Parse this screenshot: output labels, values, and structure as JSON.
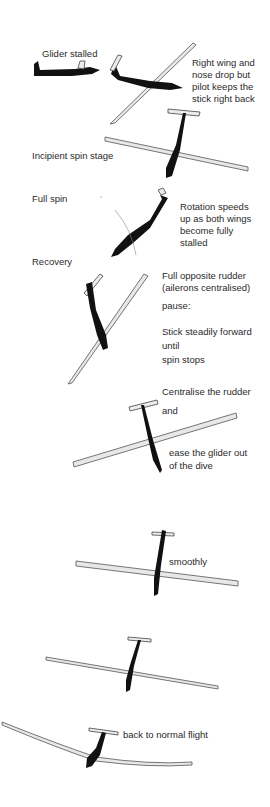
{
  "diagram": {
    "stages": [
      {
        "id": "stalled",
        "label": "Glider stalled"
      },
      {
        "id": "incipient",
        "label": "Incipient spin stage"
      },
      {
        "id": "full_spin",
        "label": "Full spin"
      },
      {
        "id": "recovery",
        "label": "Recovery"
      }
    ],
    "notes": {
      "wing_drop": [
        "Right wing and",
        "nose drop but",
        "pilot keeps the",
        "stick right back"
      ],
      "rotation": [
        "Rotation speeds",
        "up as both wings",
        "become fully",
        "stalled"
      ],
      "rudder": [
        "Full opposite rudder",
        "(ailerons centralised)"
      ],
      "pause": "pause:",
      "stick": [
        "Stick steadily forward",
        "until",
        "spin stops"
      ],
      "centralise": "Centralise the rudder",
      "and": "and",
      "ease": [
        "ease the glider out",
        "of the dive"
      ],
      "smoothly": "smoothly",
      "normal": "back to normal flight"
    }
  }
}
